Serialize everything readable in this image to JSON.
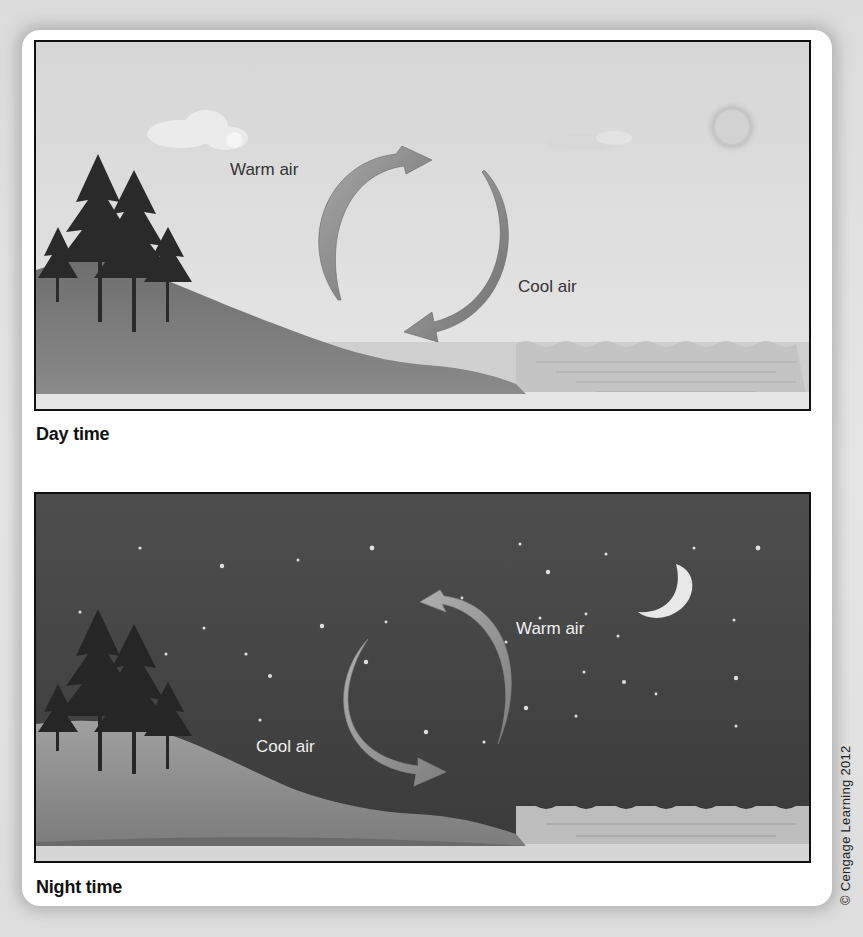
{
  "figure": {
    "copyright": "© Cengage Learning 2012",
    "panels": [
      {
        "id": "day",
        "caption": "Day time",
        "labels": {
          "warm": "Warm air",
          "cool": "Cool air"
        },
        "colors": {
          "sky": "#dcdcdc",
          "land": "#7a7a7a",
          "water": "#cfcfcf",
          "arrow": "#8a8a8a"
        },
        "elements": [
          "sun-icon",
          "cloud-icon",
          "cloud-icon",
          "trees",
          "hill",
          "sea",
          "circulation-arrows"
        ]
      },
      {
        "id": "night",
        "caption": "Night time",
        "labels": {
          "warm": "Warm air",
          "cool": "Cool air"
        },
        "colors": {
          "sky": "#4a4a4a",
          "land": "#8c8c8c",
          "water": "#bdbdbd",
          "arrow": "#9a9a9a"
        },
        "elements": [
          "moon-icon",
          "star-icon",
          "trees",
          "hill",
          "sea",
          "circulation-arrows"
        ]
      }
    ]
  }
}
